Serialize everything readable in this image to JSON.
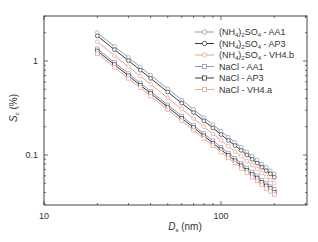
{
  "chart_data": {
    "type": "line",
    "title": "",
    "xlabel": "D_s (nm)",
    "xlabel_main": "D",
    "xlabel_sub": "s",
    "xlabel_unit": " (nm)",
    "ylabel": "S_c (%)",
    "ylabel_main": "S",
    "ylabel_sub": "c",
    "ylabel_unit": " (%)",
    "xscale": "log",
    "yscale": "log",
    "xlim": [
      10,
      300
    ],
    "ylim": [
      0.03,
      3.0
    ],
    "x_ticks": [
      10,
      100
    ],
    "x_tick_labels": [
      "10",
      "100"
    ],
    "y_ticks": [
      0.1,
      1
    ],
    "y_tick_labels": [
      "0.1",
      "1"
    ],
    "grid": false,
    "legend_position": "upper right",
    "x": [
      20,
      25,
      30,
      35,
      40,
      50,
      60,
      70,
      80,
      90,
      100,
      110,
      120,
      130,
      140,
      150,
      160,
      170,
      180,
      190,
      200
    ],
    "series": [
      {
        "name": "(NH4)2SO4 - AA1",
        "label_parts": [
          "(NH",
          "4",
          ")",
          "2",
          "SO",
          "4",
          " - AA1"
        ],
        "color": "#8a9bb8",
        "marker": "circle",
        "values": [
          2.0,
          1.43,
          1.09,
          0.865,
          0.707,
          0.506,
          0.385,
          0.306,
          0.25,
          0.21,
          0.179,
          0.155,
          0.136,
          0.121,
          0.108,
          0.097,
          0.088,
          0.08,
          0.074,
          0.068,
          0.063
        ]
      },
      {
        "name": "(NH4)2SO4 - AP3",
        "label_parts": [
          "(NH",
          "4",
          ")",
          "2",
          "SO",
          "4",
          " - AP3"
        ],
        "color": "#3a3a3a",
        "marker": "circle",
        "values": [
          1.85,
          1.32,
          1.01,
          0.8,
          0.654,
          0.468,
          0.356,
          0.283,
          0.231,
          0.194,
          0.165,
          0.143,
          0.126,
          0.112,
          0.1,
          0.09,
          0.082,
          0.074,
          0.068,
          0.063,
          0.058
        ]
      },
      {
        "name": "(NH4)2SO4 - VH4.b",
        "label_parts": [
          "(NH",
          "4",
          ")",
          "2",
          "SO",
          "4",
          " - VH4.b"
        ],
        "color": "#e9a493",
        "marker": "circle",
        "values": [
          1.6,
          1.14,
          0.87,
          0.69,
          0.566,
          0.405,
          0.308,
          0.245,
          0.2,
          0.168,
          0.143,
          0.124,
          0.109,
          0.097,
          0.086,
          0.078,
          0.071,
          0.064,
          0.059,
          0.054,
          0.05
        ]
      },
      {
        "name": "NaCl - AA1",
        "label_parts": [
          "NaCl - AA1"
        ],
        "color": "#8a9bb8",
        "marker": "square",
        "values": [
          1.35,
          0.966,
          0.735,
          0.584,
          0.477,
          0.342,
          0.26,
          0.206,
          0.169,
          0.142,
          0.121,
          0.105,
          0.092,
          0.082,
          0.073,
          0.066,
          0.06,
          0.054,
          0.05,
          0.046,
          0.043
        ]
      },
      {
        "name": "NaCl - AP3",
        "label_parts": [
          "NaCl - AP3"
        ],
        "color": "#3a3a3a",
        "marker": "square",
        "values": [
          1.28,
          0.916,
          0.697,
          0.553,
          0.453,
          0.324,
          0.246,
          0.196,
          0.16,
          0.134,
          0.114,
          0.099,
          0.087,
          0.077,
          0.069,
          0.062,
          0.057,
          0.051,
          0.047,
          0.044,
          0.04
        ]
      },
      {
        "name": "NaCl - VH4.a",
        "label_parts": [
          "NaCl - VH4.a"
        ],
        "color": "#e9a493",
        "marker": "square",
        "values": [
          1.2,
          0.859,
          0.653,
          0.519,
          0.424,
          0.304,
          0.231,
          0.183,
          0.15,
          0.126,
          0.107,
          0.093,
          0.082,
          0.072,
          0.065,
          0.058,
          0.053,
          0.048,
          0.044,
          0.041,
          0.038
        ]
      }
    ]
  }
}
